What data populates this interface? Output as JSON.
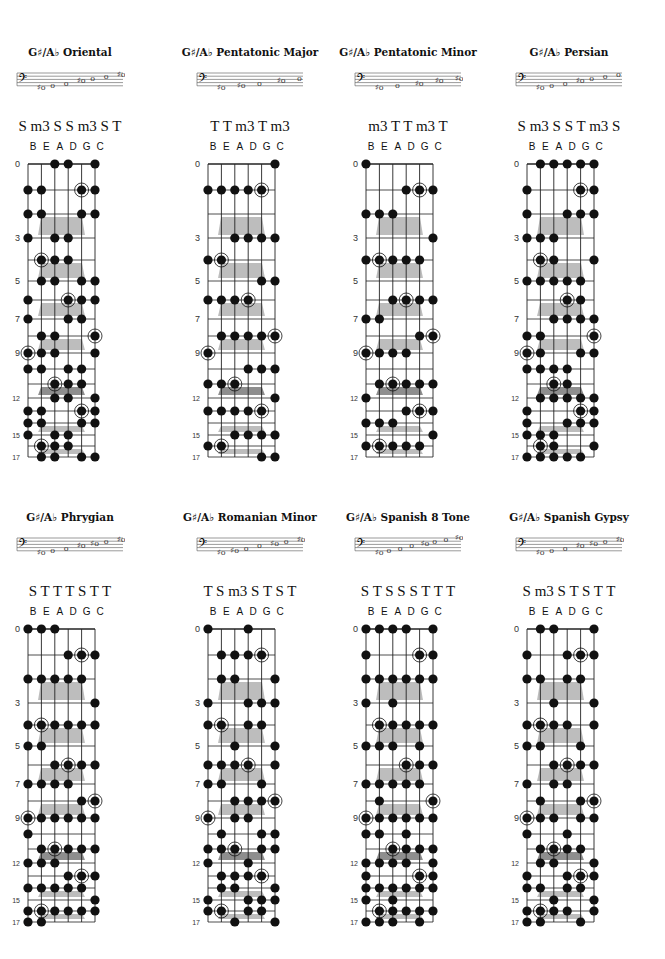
{
  "page": {
    "tuning": [
      "B",
      "E",
      "A",
      "D",
      "G",
      "C"
    ],
    "fret_numbers_shown": [
      "0",
      "3",
      "5",
      "7",
      "9",
      "12",
      "15",
      "17"
    ],
    "root": "G♯/A♭",
    "colors": {
      "dot": "#111111",
      "line": "#222222",
      "marker": "#bdbdbd",
      "marker_dark": "#8e8e8e"
    }
  },
  "diagrams": [
    {
      "title": "G♯/A♭ Oriental",
      "intervals": "S m3 S S m3 S T",
      "staff_notes": [
        "♯o",
        "o",
        "o",
        "♯o",
        "o",
        "o",
        "♯o"
      ],
      "dots": {
        "B": [
          1,
          2,
          3,
          6,
          7,
          9,
          10,
          13,
          14,
          15
        ],
        "E": [
          1,
          2,
          4,
          5,
          8,
          9,
          10,
          13,
          14,
          16,
          17
        ],
        "A": [
          0,
          3,
          4,
          5,
          8,
          9,
          11,
          12,
          15,
          16,
          17
        ],
        "D": [
          0,
          3,
          4,
          6,
          7,
          10,
          11,
          12,
          15,
          16
        ],
        "G": [
          1,
          2,
          5,
          6,
          7,
          10,
          11,
          13,
          14,
          17
        ],
        "C": [
          0,
          1,
          2,
          5,
          6,
          8,
          9,
          12,
          13,
          14,
          17
        ]
      }
    },
    {
      "title": "G♯/A♭ Pentatonic Major",
      "intervals": "T T m3 T m3",
      "staff_notes": [
        "♯o",
        "♯o",
        "o",
        "♯o",
        "o"
      ],
      "dots": {
        "B": [
          1,
          4,
          6,
          9,
          11,
          13,
          16
        ],
        "E": [
          1,
          4,
          6,
          8,
          11,
          13,
          16
        ],
        "A": [
          1,
          3,
          6,
          8,
          11,
          13,
          15
        ],
        "D": [
          1,
          3,
          6,
          8,
          10,
          13,
          15
        ],
        "G": [
          1,
          3,
          5,
          8,
          10,
          13,
          15,
          17
        ],
        "C": [
          0,
          3,
          5,
          8,
          10,
          12,
          15,
          17
        ]
      }
    },
    {
      "title": "G♯/A♭ Pentatonic Minor",
      "intervals": "m3 T T m3 T",
      "staff_notes": [
        "♯o",
        "o",
        "♯o",
        "♯o",
        "♯o"
      ],
      "dots": {
        "B": [
          0,
          2,
          4,
          7,
          9,
          12,
          14,
          16
        ],
        "E": [
          2,
          4,
          7,
          9,
          11,
          14,
          16
        ],
        "A": [
          2,
          4,
          6,
          9,
          11,
          14,
          16
        ],
        "D": [
          1,
          4,
          6,
          9,
          11,
          13,
          16
        ],
        "G": [
          1,
          4,
          6,
          8,
          11,
          13,
          16
        ],
        "C": [
          1,
          3,
          6,
          8,
          11,
          13,
          15
        ]
      }
    },
    {
      "title": "G♯/A♭ Persian",
      "intervals": "S m3 S S T m3 S",
      "staff_notes": [
        "♯o",
        "o",
        "o",
        "♯o",
        "o",
        "o",
        "o"
      ],
      "dots": {
        "B": [
          1,
          2,
          3,
          5,
          8,
          9,
          10,
          13,
          14,
          15,
          17
        ],
        "E": [
          0,
          3,
          4,
          5,
          8,
          9,
          10,
          12,
          15,
          16,
          17
        ],
        "A": [
          0,
          3,
          4,
          5,
          7,
          10,
          11,
          12,
          15,
          16,
          17
        ],
        "D": [
          0,
          2,
          5,
          6,
          7,
          10,
          11,
          12,
          14,
          17
        ],
        "G": [
          0,
          1,
          2,
          5,
          6,
          7,
          9,
          12,
          13,
          14,
          17
        ],
        "C": [
          0,
          1,
          2,
          4,
          7,
          8,
          9,
          12,
          13,
          14,
          16
        ]
      }
    },
    {
      "title": "G♯/A♭ Phrygian",
      "intervals": "S T T T S T T",
      "staff_notes": [
        "♯o",
        "o",
        "o",
        "♯o",
        "♯o",
        "o",
        "♯o"
      ],
      "dots": {
        "B": [
          0,
          2,
          4,
          5,
          7,
          9,
          10,
          12,
          14,
          16,
          17
        ],
        "E": [
          0,
          2,
          4,
          5,
          7,
          9,
          11,
          12,
          14,
          16,
          17
        ],
        "A": [
          0,
          2,
          4,
          6,
          7,
          9,
          11,
          12,
          14,
          16
        ],
        "D": [
          1,
          2,
          4,
          6,
          7,
          9,
          11,
          13,
          14,
          16
        ],
        "G": [
          1,
          2,
          4,
          6,
          8,
          9,
          11,
          13,
          14,
          16
        ],
        "C": [
          1,
          3,
          4,
          6,
          8,
          9,
          11,
          13,
          15,
          16
        ]
      }
    },
    {
      "title": "G♯/A♭ Romanian Minor",
      "intervals": "T S m3 S T S T",
      "staff_notes": [
        "♯o",
        "♯o",
        "o",
        "o",
        "♯o",
        "o",
        "♯o"
      ],
      "dots": {
        "B": [
          0,
          3,
          4,
          6,
          7,
          9,
          11,
          12,
          15,
          16
        ],
        "E": [
          1,
          2,
          4,
          6,
          7,
          10,
          11,
          13,
          14,
          16
        ],
        "A": [
          1,
          2,
          5,
          6,
          8,
          9,
          11,
          13,
          14,
          17
        ],
        "D": [
          0,
          1,
          3,
          4,
          6,
          8,
          9,
          12,
          13,
          15,
          16
        ],
        "G": [
          1,
          3,
          4,
          7,
          8,
          10,
          11,
          13,
          15,
          16
        ],
        "C": [
          2,
          3,
          5,
          6,
          8,
          10,
          11,
          14,
          15,
          17
        ]
      }
    },
    {
      "title": "G♯/A♭ Spanish 8 Tone",
      "intervals": "S T S S S T T T",
      "staff_notes": [
        "♯o",
        "o",
        "o",
        "o",
        "♯o",
        "o",
        "o",
        "♯o"
      ],
      "dots": {
        "B": [
          0,
          1,
          2,
          3,
          5,
          7,
          9,
          10,
          12,
          13,
          14,
          15,
          17
        ],
        "E": [
          0,
          2,
          4,
          5,
          7,
          8,
          9,
          10,
          12,
          14,
          16,
          17
        ],
        "A": [
          0,
          2,
          3,
          4,
          5,
          7,
          9,
          11,
          12,
          14,
          15,
          16,
          17
        ],
        "D": [
          0,
          2,
          4,
          6,
          7,
          9,
          10,
          11,
          12,
          14,
          16
        ],
        "G": [
          1,
          2,
          4,
          5,
          6,
          7,
          9,
          11,
          13,
          14,
          16,
          17
        ],
        "C": [
          0,
          1,
          2,
          4,
          6,
          8,
          9,
          11,
          12,
          13,
          14,
          16
        ]
      }
    },
    {
      "title": "G♯/A♭ Spanish Gypsy",
      "intervals": "S m3 S T S T T",
      "staff_notes": [
        "♯o",
        "o",
        "o",
        "♯o",
        "♯o",
        "o",
        "♯o"
      ],
      "dots": {
        "B": [
          1,
          2,
          4,
          5,
          7,
          9,
          10,
          13,
          14,
          16,
          17
        ],
        "E": [
          0,
          2,
          4,
          5,
          8,
          9,
          11,
          12,
          14,
          16,
          17
        ],
        "A": [
          0,
          3,
          4,
          6,
          7,
          9,
          11,
          12,
          15,
          16
        ],
        "D": [
          1,
          2,
          4,
          6,
          7,
          10,
          11,
          13,
          14,
          16
        ],
        "G": [
          1,
          2,
          5,
          6,
          8,
          9,
          11,
          13,
          14,
          17
        ],
        "C": [
          0,
          1,
          3,
          4,
          6,
          8,
          9,
          12,
          13,
          15,
          16
        ]
      }
    }
  ],
  "roots": {
    "B": [
      9
    ],
    "E": [
      4,
      16
    ],
    "A": [
      11
    ],
    "D": [
      6
    ],
    "G": [
      1,
      13
    ],
    "C": [
      8
    ]
  }
}
